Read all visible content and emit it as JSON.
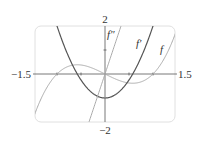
{
  "chart_data": {
    "type": "line",
    "title": "",
    "xlabel": "",
    "ylabel": "",
    "xlim": [
      -1.5,
      1.5
    ],
    "ylim": [
      -2,
      2
    ],
    "grid": false,
    "legend": "inline labels",
    "tick_labels": {
      "x_min": "−1.5",
      "x_max": "1.5",
      "y_max": "2",
      "y_min": "−2"
    },
    "x_ticks": [
      -1,
      -0.5,
      0.5,
      1
    ],
    "y_ticks": [
      1
    ],
    "series": [
      {
        "name": "f",
        "label": "f",
        "expression": "x^3 - x",
        "color": "#aaaaaa",
        "x": [
          -1.5,
          -1,
          -0.577,
          0,
          0.577,
          1,
          1.5
        ],
        "values": [
          -1.875,
          0,
          0.385,
          0,
          -0.385,
          0,
          1.875
        ]
      },
      {
        "name": "f'",
        "label": "f′",
        "expression": "3x^2 - 1",
        "color": "#555555",
        "x": [
          -1.5,
          -1,
          -0.577,
          0,
          0.577,
          1,
          1.5
        ],
        "values": [
          5.75,
          2,
          0,
          -1,
          0,
          2,
          5.75
        ]
      },
      {
        "name": "f''",
        "label": "f″",
        "expression": "6x",
        "color": "#aaaaaa",
        "x": [
          -1.5,
          -0.5,
          0,
          0.5,
          1.5
        ],
        "values": [
          -9,
          -3,
          0,
          3,
          9
        ]
      }
    ]
  }
}
